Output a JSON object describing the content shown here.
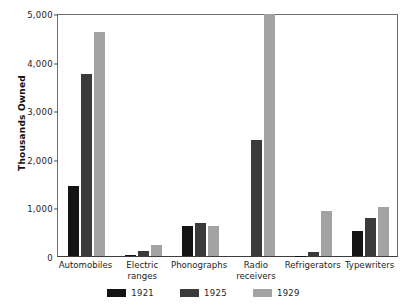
{
  "chart_data": {
    "type": "bar",
    "title": "",
    "subtitle": "",
    "xlabel": "",
    "ylabel": "Thousands Owned",
    "ylim": [
      0,
      5000
    ],
    "yticks": [
      0,
      1000,
      2000,
      3000,
      4000,
      5000
    ],
    "ytick_labels": [
      "0",
      "1,000",
      "2,000",
      "3,000",
      "4,000",
      "5,000"
    ],
    "grid": false,
    "legend_position": "bottom",
    "categories": [
      "Automobiles",
      "Electric\nranges",
      "Phonographs",
      "Radio\nreceivers",
      "Refrigerators",
      "Typewriters"
    ],
    "series": [
      {
        "name": "1921",
        "color": "#141414",
        "values": [
          1450,
          20,
          620,
          0,
          5,
          520
        ]
      },
      {
        "name": "1925",
        "color": "#3a3a3a",
        "values": [
          3750,
          100,
          670,
          2380,
          90,
          790
        ]
      },
      {
        "name": "1929",
        "color": "#a3a3a3",
        "values": [
          4600,
          230,
          620,
          4980,
          920,
          1000
        ]
      }
    ]
  },
  "axis": {
    "y_title": "Thousands Owned"
  },
  "legend": {
    "items": [
      {
        "label": "1921",
        "color": "#141414"
      },
      {
        "label": "1925",
        "color": "#3a3a3a"
      },
      {
        "label": "1929",
        "color": "#a3a3a3"
      }
    ]
  }
}
